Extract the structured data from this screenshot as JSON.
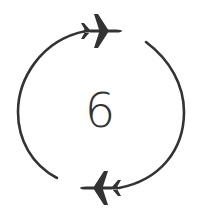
{
  "icon": {
    "semantic": "round-trip-flight-counter",
    "number": "6",
    "color": "#333333",
    "background": "#ffffff"
  }
}
